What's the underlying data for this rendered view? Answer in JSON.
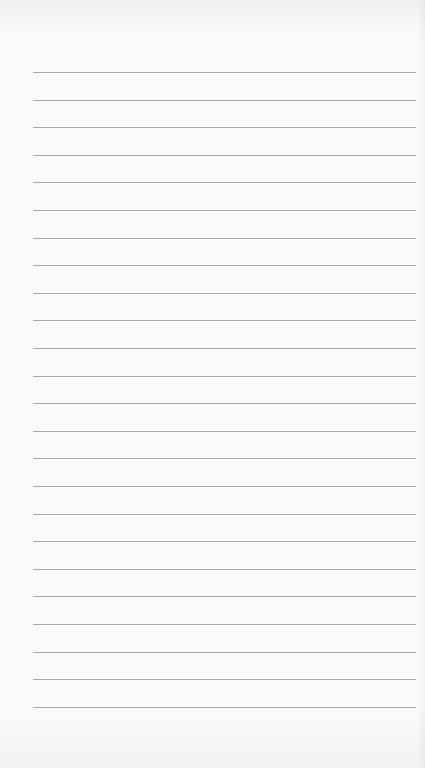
{
  "page": {
    "type": "lined-paper",
    "background_color": "#fbfbfb",
    "line_color": "#9a9a9a",
    "line_count": 24,
    "first_line_y": 72,
    "line_spacing": 27.6,
    "line_left": 33,
    "line_right": 416
  }
}
